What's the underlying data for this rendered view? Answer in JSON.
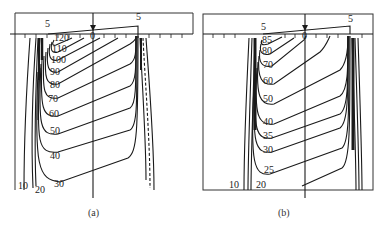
{
  "figure": {
    "panels": [
      {
        "id": "a",
        "caption": "(a)",
        "top_labels": {
          "left": "5",
          "right": "5",
          "center": "0"
        },
        "contour_labels": [
          "120",
          "110",
          "100",
          "90",
          "80",
          "70",
          "60",
          "50",
          "40",
          "30",
          "20",
          "10"
        ]
      },
      {
        "id": "b",
        "caption": "(b)",
        "top_labels": {
          "left": "5",
          "right": "5",
          "center": "0"
        },
        "contour_labels": [
          "85",
          "80",
          "70",
          "60",
          "50",
          "40",
          "35",
          "30",
          "25",
          "20",
          "10"
        ]
      }
    ],
    "colors": {
      "line": "#1a1a1a",
      "background": "#ffffff"
    }
  }
}
